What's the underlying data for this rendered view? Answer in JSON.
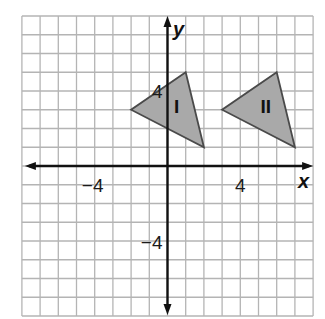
{
  "figure": {
    "type": "coordinate-plane",
    "grid": {
      "x_min": -8,
      "x_max": 8,
      "y_min": -8,
      "y_max": 8,
      "step": 1
    },
    "axes": {
      "x_label": "x",
      "y_label": "y",
      "x_ticks": [
        {
          "value": -4,
          "label": "−4"
        },
        {
          "value": 4,
          "label": "4"
        }
      ],
      "y_ticks": [
        {
          "value": 4,
          "label": "4"
        },
        {
          "value": -4,
          "label": "−4"
        }
      ]
    },
    "shapes": [
      {
        "name": "I",
        "label": "I",
        "vertices": [
          [
            1,
            5
          ],
          [
            -2,
            3
          ],
          [
            2,
            1
          ]
        ],
        "label_pos": [
          0.5,
          3.2
        ]
      },
      {
        "name": "II",
        "label": "II",
        "vertices": [
          [
            6,
            5
          ],
          [
            3,
            3
          ],
          [
            7,
            1
          ]
        ],
        "label_pos": [
          5.4,
          3.2
        ]
      }
    ],
    "colors": {
      "grid": "#b4b4b4",
      "axis": "#111111",
      "triangle_fill": "#a9a9a9",
      "triangle_stroke": "#4a4a4a"
    }
  }
}
